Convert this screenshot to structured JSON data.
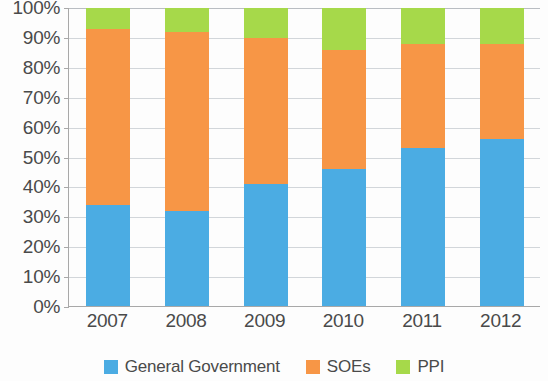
{
  "chart_data": {
    "type": "bar",
    "stacked": true,
    "stack_mode": "percent",
    "title": "",
    "subtitle": "",
    "xlabel": "",
    "ylabel": "",
    "categories": [
      "2007",
      "2008",
      "2009",
      "2010",
      "2011",
      "2012"
    ],
    "ylim": [
      0,
      100
    ],
    "ytick_values": [
      0,
      10,
      20,
      30,
      40,
      50,
      60,
      70,
      80,
      90,
      100
    ],
    "ytick_labels": [
      "0%",
      "10%",
      "20%",
      "30%",
      "40%",
      "50%",
      "60%",
      "70%",
      "80%",
      "90%",
      "100%"
    ],
    "grid": true,
    "grid_axis": "y",
    "legend_position": "bottom",
    "series": [
      {
        "name": "General Government",
        "color": "#4BACE3",
        "values": [
          34,
          32,
          41,
          46,
          53,
          56
        ]
      },
      {
        "name": "SOEs",
        "color": "#F79646",
        "values": [
          59,
          60,
          49,
          40,
          35,
          32
        ]
      },
      {
        "name": "PPI",
        "color": "#A6D94A",
        "values": [
          7,
          8,
          10,
          14,
          12,
          12
        ]
      }
    ]
  },
  "axis": {
    "axis_line_color": "#a8a8a8",
    "grid_color": "#d2d6da",
    "tick_text_color": "#4a4a4a"
  }
}
